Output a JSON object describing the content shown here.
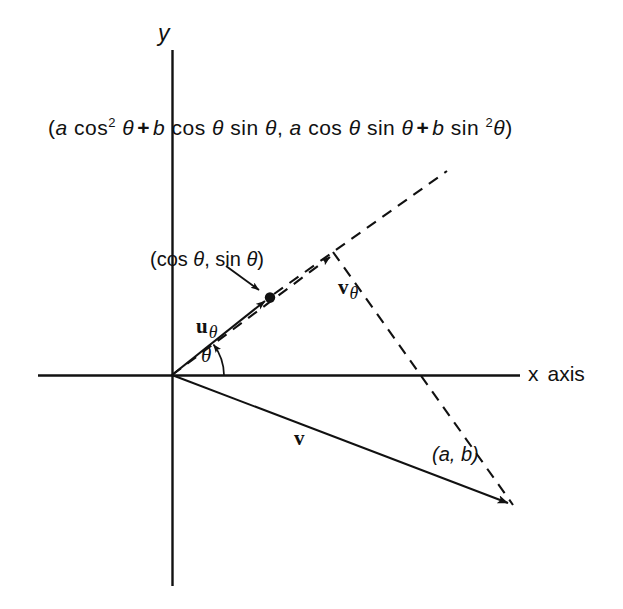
{
  "figure": {
    "title_text": "",
    "background_color": "#ffffff",
    "ink_color": "#111111",
    "axes": {
      "x_label": "x",
      "x_label_suffix": "axis",
      "y_label": "y",
      "origin": [
        172,
        375
      ]
    },
    "formula": {
      "open_paren": "(",
      "term1_coef": "a",
      "term1_fn": "cos",
      "term1_exp": "2",
      "term1_var": "θ",
      "plus1": "+",
      "term2_coef": "b",
      "term2_fn1": "cos",
      "term2_var1": "θ",
      "term2_fn2": "sin",
      "term2_var2": "θ",
      "comma": ",",
      "term3_coef": "a",
      "term3_fn1": "cos",
      "term3_var1": "θ",
      "term3_fn2": "sin",
      "term3_var2": "θ",
      "plus2": "+",
      "term4_coef": "b",
      "term4_fn": "sin",
      "term4_exp": "2",
      "term4_var": "θ",
      "close_paren": ")",
      "plain": "(a cos² θ + b cos θ sin θ, a cos θ sin θ + b sin ²θ)"
    },
    "labels": {
      "point_coords": "(cos θ, sin θ)",
      "point_open": "(",
      "point_fn1": "cos",
      "point_var1": "θ",
      "point_comma": ",",
      "point_fn2": "sin",
      "point_var2": "θ",
      "point_close": ")",
      "u_theta": "u",
      "u_theta_sub": "θ",
      "v_theta": "v",
      "v_theta_sub": "θ",
      "v": "v",
      "theta_angle": "θ",
      "ab_point": "(a, b)"
    },
    "geometry": {
      "x_axis": {
        "x1": 38,
        "y1": 375,
        "x2": 520,
        "y2": 375
      },
      "y_axis": {
        "x1": 172,
        "y1": 50,
        "x2": 172,
        "y2": 586
      },
      "u_vector": {
        "x1": 172,
        "y1": 375,
        "x2": 270,
        "y2": 298,
        "style": "solid",
        "arrow": true
      },
      "u_ray_dashed": {
        "x1": 270,
        "y1": 298,
        "x2": 447,
        "y2": 172,
        "style": "dashed"
      },
      "v_theta_vector": {
        "x1": 172,
        "y1": 375,
        "x2": 330,
        "y2": 255,
        "style": "dashed",
        "arrow": true
      },
      "projection_line": {
        "x1": 332,
        "y1": 253,
        "x2": 512,
        "y2": 505,
        "style": "dashed"
      },
      "v_vector": {
        "x1": 172,
        "y1": 375,
        "x2": 512,
        "y2": 505,
        "style": "solid",
        "arrow": true
      },
      "unit_point_dot": {
        "cx": 270,
        "cy": 297,
        "r": 5
      },
      "pointer_arrow": {
        "x1": 228,
        "y1": 268,
        "x2": 262,
        "y2": 292
      },
      "theta_arc": {
        "cx": 172,
        "cy": 375,
        "r": 52,
        "start_deg": 0,
        "end_deg": 38
      }
    }
  }
}
